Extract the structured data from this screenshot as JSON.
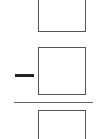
{
  "expression": {
    "numerator_top_box": {
      "value": ""
    },
    "numerator_box": {
      "value": "",
      "sign": "minus"
    },
    "denominator_box": {
      "value": ""
    },
    "fraction_bar": true
  },
  "colors": {
    "box_border": "#555555",
    "minus_sign": "#222222",
    "fraction_bar": "#666666",
    "background": "#ffffff"
  }
}
